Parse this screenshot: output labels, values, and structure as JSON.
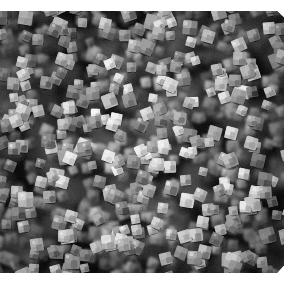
{
  "page": {
    "background_color": "#ffffff",
    "width": 302,
    "height": 299,
    "alt_text": "Scanning electron micrograph of densely packed cubic nanoparticles"
  },
  "micrograph": {
    "name": "sem-nanocube-micrograph",
    "modality": "SEM",
    "subject": "monodisperse cubic nanoparticles (nanocubes)",
    "orientation": "plan view",
    "color_mode": "grayscale",
    "frame": {
      "left": 0,
      "top": 11,
      "width": 284,
      "height": 262
    },
    "palette": {
      "page": "#ffffff",
      "background": "#070707",
      "shadow": "#000000",
      "particle_dark": "#3a3a3a",
      "particle_mid": "#8f8f8f",
      "particle_bright": "#d8d8d8",
      "particle_highlight": "#f2f2f2",
      "haze": "#4a4a4a"
    },
    "appearance": {
      "particle_shape": "cube",
      "packing": "dense monolayer, near close-packed",
      "approx_particle_size_px": 11,
      "size_range_px": [
        7,
        16
      ],
      "approx_particle_count": 900,
      "background_tone": "black",
      "focus_note": "foreground cubes sharp; underlying layer blurred",
      "illumination": "center-bright with corner vignette"
    },
    "annotations": {
      "scale_bar": null,
      "caption": null,
      "labels": []
    }
  }
}
